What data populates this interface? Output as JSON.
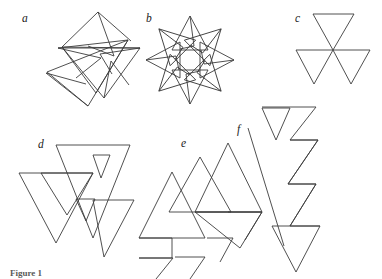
{
  "figure": {
    "caption": "Figure 1",
    "background_color": "#ffffff",
    "stroke_color": "#3c3c3c",
    "panels": [
      {
        "id": "a",
        "label": "a",
        "label_x": 22,
        "label_y": 22,
        "description": "five-pointed star outline with small inward triangular barbs at each point",
        "polylines": [
          "62,47 95,95 78,42 58,48 128,40 96,93 75,45",
          "62,47 98,13 130,41",
          "75,45 99,14 126,42",
          "96,93 140,48 99,53 106,84",
          "99,53 139,49 104,83",
          "58,48 40,92 88,105 47,73",
          "70,70 40,91 86,103",
          "128,40 104,98 131,86 110,62",
          "110,62 129,86 104,97",
          "95,95 47,72 88,106"
        ]
      },
      {
        "id": "b",
        "label": "b",
        "label_x": 146,
        "label_y": 22,
        "description": "eight-fold rotationally symmetric star rosette of barbed triangles around a central circular void",
        "rotational_symmetry": 8,
        "center_x": 190,
        "center_y": 60,
        "unit_polyline": "0,-44 16,-12 -16,-12 0,-44 2,-20 -6,-16 0,-44",
        "inner_void_radius": 10
      },
      {
        "id": "c",
        "label": "c",
        "label_x": 295,
        "label_y": 22,
        "description": "three congruent downward-pointing triangles meeting at a single shared central vertex",
        "center_x": 333,
        "center_y": 50,
        "triangles": [
          "313,14 353,14 333,50",
          "296,50 333,50 314,84",
          "333,50 370,50 351,84"
        ]
      },
      {
        "id": "d",
        "label": "d",
        "label_x": 38,
        "label_y": 148,
        "description": "three large overlapping downward triangles with two small inner triangles, an overlapped version of panel c",
        "polylines": [
          "55,146 128,146 92,238",
          "19,174 128,174 55,242",
          "55,174 128,174 92,230",
          "92,174 128,174 110,200",
          "19,174 92,174 55,242",
          "55,174 92,174 74,214",
          "74,214 110,214 92,230",
          "74,174 128,200 92,230"
        ],
        "triangles": [
          "55,146 128,146 92,238",
          "19,174 92,174 55,242",
          "55,200 128,200 92,256",
          "92,158 110,158 101,178",
          "74,200 92,200 83,218"
        ]
      },
      {
        "id": "e",
        "label": "e",
        "label_x": 181,
        "label_y": 147,
        "description": "overlapping upward-pointing triangles whose lower edges are broken into stepped zigzag notches",
        "polylines": [
          "170,174 195,218 152,218 170,174",
          "140,240 175,240 158,268",
          "228,143 266,212 190,212 228,143",
          "200,156 232,212 168,212 200,156",
          "172,173 205,230 139,230 172,173",
          "190,212 240,212 215,250 190,212",
          "228,212 254,212 241,236 228,212",
          "205,236 232,236 218,260 205,236"
        ],
        "zigzag": "138,258 171,258 171,240 196,240 196,222 228,222 228,205 254,205"
      },
      {
        "id": "f",
        "label": "f",
        "label_x": 237,
        "label_y": 133,
        "description": "tall lightning-bolt zigzag band formed of chained triangular notches beside a long diagonal line",
        "diagonal": "248,128 282,244",
        "polylines": [
          "264,128 285,128 272,152 264,128",
          "261,106 294,106 278,140",
          "290,106 316,106 303,136 290,106"
        ],
        "bolt": "262,107 316,107 290,140 316,140 285,182 313,182 288,224 318,224 296,270 290,244 308,226 278,226 300,184 272,184 294,142 268,142 290,109"
      }
    ]
  }
}
